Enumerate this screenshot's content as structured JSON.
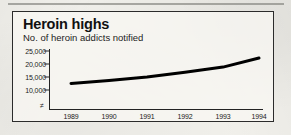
{
  "page": {
    "background_color": "#f2f1ec",
    "top_rule_color": "#8e8e88"
  },
  "chart_box": {
    "border_color": "#2b2b2b"
  },
  "chart_data": {
    "type": "line",
    "title": "Heroin highs",
    "subtitle": "No. of heroin addicts notified",
    "xlabel": "",
    "ylabel": "",
    "categories": [
      "1989",
      "1990",
      "1991",
      "1992",
      "1993",
      "1994"
    ],
    "values": [
      12500,
      13700,
      15000,
      16800,
      18800,
      22300
    ],
    "series": [
      {
        "name": "No. of heroin addicts notified",
        "values": [
          12500,
          13700,
          15000,
          16800,
          18800,
          22300
        ],
        "color": "#000000"
      }
    ],
    "ylim": [
      10000,
      25000
    ],
    "y_ticks": [
      25000,
      20000,
      15000,
      10000
    ],
    "y_tick_labels": [
      "25,000",
      "20,000",
      "15,000",
      "10,000"
    ],
    "x_tick_labels": [
      "1989",
      "1990",
      "1991",
      "1992",
      "1993",
      "1994"
    ],
    "axis_break_symbol": "≠",
    "axis_break_note": "y-axis broken below 10,000",
    "grid": false,
    "legend": false,
    "legend_position": "none",
    "line_color": "#000000",
    "line_width_px": 3,
    "axis_color": "#232323"
  }
}
